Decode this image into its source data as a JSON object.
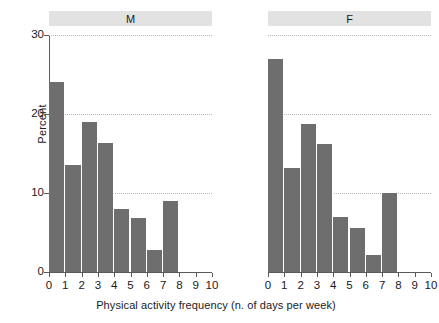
{
  "chart_data": {
    "type": "bar",
    "title": "",
    "xlabel": "Physical activity frequency (n. of days per week)",
    "ylabel": "Percent",
    "xlim": [
      0,
      10
    ],
    "ylim": [
      0,
      30
    ],
    "x_ticks": [
      0,
      1,
      2,
      3,
      4,
      5,
      6,
      7,
      8,
      9,
      10
    ],
    "y_ticks": [
      0,
      10,
      20,
      30
    ],
    "grid": "horizontal-dotted",
    "legend": "none",
    "bar_color": "#6e6e6e",
    "panel_strip_color": "#e2e2e2",
    "gridline_color": "#b9b9b9",
    "axis_color": "#5a5a5a",
    "panels": [
      {
        "label": "M",
        "categories": [
          0,
          1,
          2,
          3,
          4,
          5,
          6,
          7
        ],
        "values": [
          24.0,
          13.5,
          19.0,
          16.3,
          8.0,
          6.8,
          2.8,
          9.0
        ]
      },
      {
        "label": "F",
        "categories": [
          0,
          1,
          2,
          3,
          4,
          5,
          6,
          7
        ],
        "values": [
          27.0,
          13.2,
          18.7,
          16.2,
          7.0,
          5.6,
          2.2,
          10.0
        ]
      }
    ]
  }
}
